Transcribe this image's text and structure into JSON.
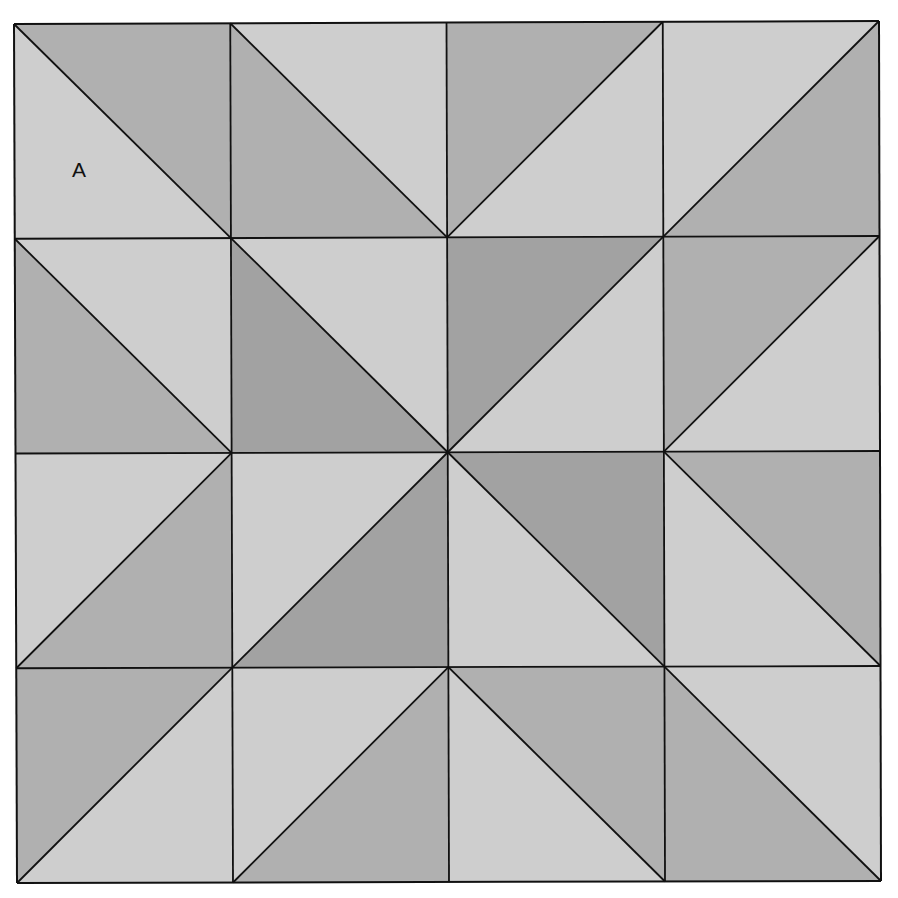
{
  "diagram": {
    "type": "quilt-block-grid",
    "rows": 4,
    "cols": 4,
    "corners": {
      "top_left": [
        14,
        24
      ],
      "top_right": [
        879,
        21
      ],
      "bottom_left": [
        17,
        883
      ],
      "bottom_right": [
        881,
        881
      ]
    },
    "colors": {
      "light": "#cecece",
      "medium": "#b0b0b0",
      "dark": "#a2a2a2",
      "line": "#111111",
      "background": "#ffffff"
    },
    "cells": [
      [
        {
          "diag": "\\",
          "shaded": "TR",
          "shade": "medium"
        },
        {
          "diag": "\\",
          "shaded": "BL",
          "shade": "medium"
        },
        {
          "diag": "/",
          "shaded": "TL",
          "shade": "medium"
        },
        {
          "diag": "/",
          "shaded": "BR",
          "shade": "medium"
        }
      ],
      [
        {
          "diag": "\\",
          "shaded": "BL",
          "shade": "medium"
        },
        {
          "diag": "\\",
          "shaded": "BL",
          "shade": "dark"
        },
        {
          "diag": "/",
          "shaded": "TL",
          "shade": "dark"
        },
        {
          "diag": "/",
          "shaded": "TL",
          "shade": "medium"
        }
      ],
      [
        {
          "diag": "/",
          "shaded": "BR",
          "shade": "medium"
        },
        {
          "diag": "/",
          "shaded": "BR",
          "shade": "dark"
        },
        {
          "diag": "\\",
          "shaded": "TR",
          "shade": "dark"
        },
        {
          "diag": "\\",
          "shaded": "TR",
          "shade": "medium"
        }
      ],
      [
        {
          "diag": "/",
          "shaded": "TL",
          "shade": "medium"
        },
        {
          "diag": "/",
          "shaded": "BR",
          "shade": "medium"
        },
        {
          "diag": "\\",
          "shaded": "TR",
          "shade": "medium"
        },
        {
          "diag": "\\",
          "shaded": "BL",
          "shade": "medium"
        }
      ]
    ],
    "labels": [
      {
        "text": "A",
        "x": 72,
        "y": 159
      }
    ]
  }
}
